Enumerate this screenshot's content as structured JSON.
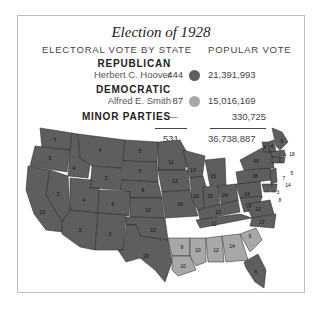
{
  "title": "Election of 1928",
  "headers": {
    "electoral": "ELECTORAL VOTE BY STATE",
    "popular": "POPULAR VOTE"
  },
  "parties": [
    {
      "party": "REPUBLICAN",
      "candidate": "Herbert C. Hoover",
      "electoral": "444",
      "popular": "21,391,993",
      "color": "#5e5e5e"
    },
    {
      "party": "DEMOCRATIC",
      "candidate": "Alfred E. Smith",
      "electoral": "87",
      "popular": "15,016,169",
      "color": "#a8a8a8"
    },
    {
      "party": "MINOR PARTIES",
      "candidate": "",
      "electoral": "—",
      "popular": "330,725"
    }
  ],
  "totals": {
    "electoral": "531",
    "popular": "36,738,887"
  },
  "colors": {
    "republican": "#5e5e5e",
    "democratic": "#a8a8a8"
  },
  "map_labels": {
    "WA": "7",
    "OR": "5",
    "CA": "13",
    "ID": "4",
    "NV": "3",
    "MT": "4",
    "WY": "3",
    "UT": "4",
    "AZ": "3",
    "CO": "6",
    "NM": "3",
    "ND": "5",
    "SD": "5",
    "NE": "8",
    "KS": "10",
    "OK": "10",
    "TX": "20",
    "MN": "12",
    "IA": "13",
    "MO": "18",
    "AR": "9",
    "LA": "10",
    "WI": "13",
    "IL": "29",
    "MI": "15",
    "IN": "15",
    "OH": "24",
    "KY": "13",
    "TN": "12",
    "MS": "10",
    "AL": "12",
    "GA": "14",
    "FL": "6",
    "SC": "9",
    "NC": "12",
    "VA": "12",
    "WV": "8",
    "PA": "38",
    "NY": "45",
    "VT": "4",
    "NH": "4",
    "ME": "6",
    "MA": "18",
    "RI": "5",
    "CT": "7",
    "NJ": "14",
    "DE": "3",
    "MD": "8"
  }
}
